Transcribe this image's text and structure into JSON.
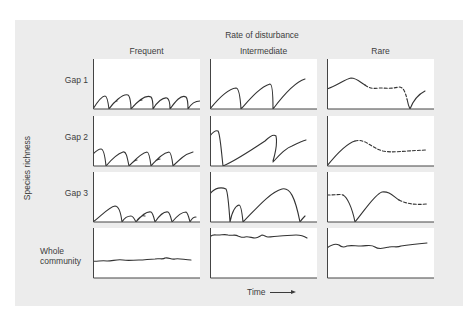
{
  "figure": {
    "title": "Rate of disturbance",
    "y_label": "Species richness",
    "x_label": "Time",
    "columns": [
      "Frequent",
      "Intermediate",
      "Rare"
    ],
    "rows": [
      "Gap 1",
      "Gap 2",
      "Gap 3",
      "Whole community"
    ],
    "row_label_lines": [
      [
        "Gap 1"
      ],
      [
        "Gap 2"
      ],
      [
        "Gap 3"
      ],
      [
        "Whole",
        "community"
      ]
    ],
    "colors": {
      "background": "#ececec",
      "panel": "#ffffff",
      "line": "#333333"
    }
  },
  "layout": {
    "col_x": [
      93,
      210,
      327
    ],
    "row_y": [
      59,
      116,
      172,
      228
    ],
    "panel_w": 107,
    "panel_h": 50
  },
  "curves": [
    [
      {
        "d": "M0,50 C5,42 9,37 12,37 C14,37 15,42 16,50 M16,50 C20,44 22,42 24,42 M16,50 C20,44 30,34 35,36 C37,37 38,45 38,50 M38,50 C43,44 47,41 49,41 M38,50 C44,43 52,35 58,38 C60,40 60,46 60,50 M60,50 C64,43 70,38 74,39 C76,40 77,45 77,50 M77,50 C82,43 88,35 93,38 C95,40 95,46 95,50 M95,50 C98,45 102,42 107,42",
        "dashed": false
      },
      {
        "d": "M0,38 C3,35 6,33 8,33 C10,33 12,40 13,50 M13,50 C18,44 24,38 30,36 C33,35 34,40 36,50 M36,50 C40,46 42,44 44,44 M36,50 C42,44 48,37 54,36 C56,36 57,42 58,50 M58,50 C62,45 65,43 67,43 M58,50 C63,44 70,37 76,36 C78,36 79,42 80,50 M80,50 C86,44 92,38 100,36",
        "dashed": false
      },
      {
        "d": "M0,50 C8,44 16,35 22,34 C26,34 28,42 29,50 M29,50 C32,45 35,44 38,44 C40,44 42,48 43,50 M43,50 C46,45 49,43 52,44 M43,50 C48,44 54,39 58,40 C60,41 61,46 62,50 M62,50 C66,44 70,39 75,40 C77,41 78,46 79,50 M79,50 C84,44 88,40 93,40 C95,41 96,46 97,50 M97,50 C99,46 101,45 103,45",
        "dashed": false
      },
      {
        "d": "M-2,33 C4,34 8,32 14,33 C20,33 24,31 30,32 C36,33 40,32 46,32 C52,32 56,31 62,31 C66,30 70,32 72,30 C76,29 78,32 82,31 C86,30 92,32 98,32",
        "dashed": false
      }
    ],
    [
      {
        "d": "M0,50 C8,40 18,30 26,29 C28,29 30,34 31,50 M31,50 C40,40 50,28 60,25 C62,25 63,32 63,50 M63,50 C72,38 85,23 95,20",
        "dashed": false
      },
      {
        "d": "M0,20 C3,16 5,14 8,15 C10,17 11,32 13,50 M13,50 C25,45 40,35 55,25 C60,20 64,18 66,20 C67,25 66,35 63,45 M63,46 C70,38 76,32 82,30 C86,28 92,25 96,24",
        "dashed": false
      },
      {
        "d": "M0,22 C5,15 12,15 16,17 C18,20 19,35 20,50 M20,50 C22,40 25,34 29,33 C31,33 32,40 33,50 M33,50 C45,38 60,20 72,17 C80,15 85,25 90,50 M90,50 C92,47 94,45 95,44",
        "dashed": false
      },
      {
        "d": "M-1,10 C2,6 4,7 8,7 C12,7 15,6 18,7 C22,8 25,6 28,8 C31,9 33,10 35,9 C38,8 42,10 45,10 C48,10 50,8 52,7 C54,7 56,9 58,9 C62,9 66,8 70,8 C75,8 80,7 86,7 C90,7 94,8 97,10",
        "dashed": false
      }
    ],
    [
      {
        "d": "M0,30 C10,27 18,20 24,19 C30,19 34,24 38,26",
        "dashed": false
      },
      {
        "d": "M38,26 C42,29 46,30 52,29 C58,29 64,30 72,28 C76,28 78,32 80,40",
        "dashed": true
      },
      {
        "d": "M80,40 C81,45 82,48 83,50 M83,50 C86,42 90,36 98,32",
        "dashed": false
      },
      {
        "d": "M0,50 C8,40 18,28 28,25",
        "dashed": false
      },
      {
        "d": "M28,25 C38,22 44,32 56,35 C66,37 74,35 100,34",
        "dashed": true
      },
      {
        "d": "M0,23 C8,23 14,22 16,23",
        "dashed": true
      },
      {
        "d": "M16,23 C20,25 25,35 28,50 M28,50 C38,38 48,22 55,20 C62,19 66,24 72,28",
        "dashed": false
      },
      {
        "d": "M72,28 C80,32 88,33 100,32",
        "dashed": true
      },
      {
        "d": "M0,20 C4,17 8,15 12,17 C14,19 16,20 20,18 C24,17 28,18 34,18 C40,18 44,16 48,19 C52,22 58,20 62,19 C66,18 70,20 74,18 C80,17 88,16 100,15",
        "dashed": false
      }
    ]
  ]
}
